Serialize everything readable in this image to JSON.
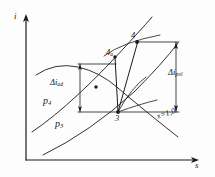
{
  "figure": {
    "kind": "thermodynamic-is-diagram",
    "ink_color": "#1b1b1b",
    "background_color": "#fdfdfd"
  },
  "axes": {
    "y_label": "i",
    "x_label": "s"
  },
  "points": [
    {
      "id": "p3",
      "label": "3",
      "label_html": "3"
    },
    {
      "id": "p4",
      "label": "4",
      "label_html": "4"
    },
    {
      "id": "p4a",
      "label": "4a",
      "label_html": "4<sub>a</sub>"
    }
  ],
  "isobars": [
    {
      "id": "isobar-p4",
      "label": "p4",
      "label_html": "p<sub>4</sub>"
    },
    {
      "id": "isobar-p3",
      "label": "p3",
      "label_html": "p<sub>3</sub>"
    }
  ],
  "annotations": {
    "delta_ad": {
      "label": "Δiad",
      "label_html": "&Delta;i<sub>ad</sub>"
    },
    "delta_pol": {
      "label": "Δipol",
      "label_html": "&Delta;i<sub>pol</sub>"
    },
    "saturation_line": {
      "label": "x=1,0",
      "label_html": "x=1,0"
    }
  },
  "chart_data": {
    "type": "line",
    "title": "",
    "xlabel": "s",
    "ylabel": "i",
    "grid": false,
    "legend": "none",
    "annotations": [
      {
        "text": "Δiad",
        "role": "adiabatic enthalpy rise bracket"
      },
      {
        "text": "Δipol",
        "role": "polytropic enthalpy rise bracket"
      },
      {
        "text": "x=1,0",
        "role": "saturation line label"
      },
      {
        "text": "p4",
        "role": "upper isobar label"
      },
      {
        "text": "p3",
        "role": "lower isobar label"
      },
      {
        "text": "3",
        "role": "start state point"
      },
      {
        "text": "4",
        "role": "polytropic end state point"
      },
      {
        "text": "4a",
        "role": "adiabatic end state point"
      }
    ],
    "series": [
      {
        "name": "isobar p3",
        "role": "pressure line, lower"
      },
      {
        "name": "isobar p4",
        "role": "pressure line, upper"
      },
      {
        "name": "saturation x=1,0",
        "role": "dome boundary curve"
      },
      {
        "name": "adiabatic 3-4a",
        "role": "vertical isentropic process"
      },
      {
        "name": "polytropic 3-4",
        "role": "inclined real process"
      },
      {
        "name": "isotherm set",
        "role": "auxiliary curves through point 3"
      }
    ]
  }
}
